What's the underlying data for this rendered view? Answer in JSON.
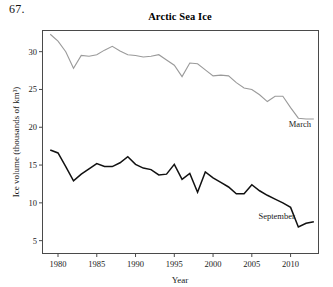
{
  "problem_number": "67.",
  "chart_data": {
    "type": "line",
    "title": "Arctic Sea Ice",
    "xlabel": "Year",
    "ylabel": "Ice volume (thousands of km³)",
    "xlim": [
      1978.0,
      2013.6
    ],
    "ylim": [
      3.3,
      32.8
    ],
    "xticks": [
      1980,
      1985,
      1990,
      1995,
      2000,
      2005,
      2010
    ],
    "xtick_labels": [
      "1980",
      "1985",
      "1990",
      "1995",
      "2000",
      "2005",
      "2010"
    ],
    "yticks": [
      5,
      10,
      15,
      20,
      25,
      30
    ],
    "ytick_labels": [
      "5",
      "10",
      "15",
      "20",
      "25",
      "30"
    ],
    "grid": false,
    "legend": "inline-annotation",
    "x": [
      1979,
      1980,
      1981,
      1982,
      1983,
      1984,
      1985,
      1986,
      1987,
      1988,
      1989,
      1990,
      1991,
      1992,
      1993,
      1994,
      1995,
      1996,
      1997,
      1998,
      1999,
      2000,
      2001,
      2002,
      2003,
      2004,
      2005,
      2006,
      2007,
      2008,
      2009,
      2010,
      2011,
      2012,
      2013
    ],
    "series": [
      {
        "name": "March",
        "color": "#9a9a9a",
        "label_x": 2011.2,
        "label_y": 20.1,
        "values": [
          32.3,
          31.4,
          30.0,
          27.8,
          29.5,
          29.4,
          29.6,
          30.2,
          30.7,
          30.1,
          29.6,
          29.5,
          29.3,
          29.4,
          29.6,
          28.9,
          28.2,
          26.7,
          28.5,
          28.4,
          27.6,
          26.8,
          26.9,
          26.8,
          25.9,
          25.2,
          25.0,
          24.3,
          23.4,
          24.1,
          24.1,
          22.6,
          21.2,
          21.1,
          21.1
        ],
        "label": "March"
      },
      {
        "name": "September",
        "color": "#111111",
        "label_x": 2008.2,
        "label_y": 7.9,
        "values": [
          17.0,
          16.6,
          14.8,
          12.9,
          13.8,
          14.5,
          15.2,
          14.8,
          14.8,
          15.3,
          16.1,
          15.1,
          14.6,
          14.4,
          13.7,
          13.8,
          15.1,
          13.1,
          13.9,
          11.4,
          14.1,
          13.3,
          12.7,
          12.1,
          11.2,
          11.2,
          12.4,
          11.6,
          11.0,
          10.5,
          10.0,
          9.4,
          6.8,
          7.3,
          7.5
        ],
        "label": "September"
      }
    ],
    "series_extra_note": "September series continues: 2010 ~7.5, 2011 ~4.9, 2012 ~4.4, 2013 ~3.6, 2014 ~5.3"
  }
}
